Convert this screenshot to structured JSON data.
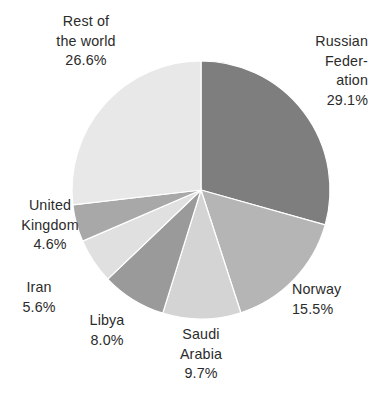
{
  "chart_data": {
    "type": "pie",
    "title": "",
    "subtitle": "",
    "xlabel": "",
    "ylabel": "",
    "legend_position": "none",
    "grid": false,
    "labels_outside": true,
    "start_angle_deg": 0,
    "direction": "clockwise",
    "categories": [
      "Russian Federation",
      "Norway",
      "Saudi Arabia",
      "Libya",
      "Iran",
      "United Kingdom",
      "Rest of the world"
    ],
    "values": [
      29.1,
      15.5,
      9.7,
      8.0,
      5.6,
      4.6,
      26.6
    ],
    "value_unit": "%",
    "slices": [
      {
        "name": "Russian Federation",
        "value": 29.1,
        "value_label": "29.1%",
        "color": "#7e7e7e",
        "label_lines": "Russian\nFeder-\nation\n29.1%"
      },
      {
        "name": "Norway",
        "value": 15.5,
        "value_label": "15.5%",
        "color": "#b5b5b5",
        "label_lines": "Norway\n15.5%"
      },
      {
        "name": "Saudi Arabia",
        "value": 9.7,
        "value_label": "9.7%",
        "color": "#d4d4d4",
        "label_lines": "Saudi\nArabia\n9.7%"
      },
      {
        "name": "Libya",
        "value": 8.0,
        "value_label": "8.0%",
        "color": "#9a9a9a",
        "label_lines": "Libya\n8.0%"
      },
      {
        "name": "Iran",
        "value": 5.6,
        "value_label": "5.6%",
        "color": "#e0e0e0",
        "label_lines": "Iran\n5.6%"
      },
      {
        "name": "United Kingdom",
        "value": 4.6,
        "value_label": "4.6%",
        "color": "#a8a8a8",
        "label_lines": "United\nKingdom\n4.6%"
      },
      {
        "name": "Rest of the world",
        "value": 26.6,
        "value_label": "26.6%",
        "color": "#e8e8e8",
        "label_lines": "Rest of\nthe world\n26.6%"
      }
    ],
    "geometry": {
      "center_x": 201,
      "center_y": 190,
      "radius": 129
    }
  },
  "labels": {
    "rest_of_world": "Rest of\nthe world\n26.6%",
    "russian_federation": "Russian\nFeder-\nation\n29.1%",
    "norway": "Norway\n15.5%",
    "saudi_arabia": "Saudi\nArabia\n9.7%",
    "libya": "Libya\n8.0%",
    "iran": "Iran\n5.6%",
    "united_kingdom": "United\nKingdom\n4.6%"
  },
  "colors": {
    "background": "#ffffff",
    "text": "#2b2b2b",
    "russian_federation": "#7e7e7e",
    "norway": "#b5b5b5",
    "saudi_arabia": "#d4d4d4",
    "libya": "#9a9a9a",
    "iran": "#e0e0e0",
    "united_kingdom": "#a8a8a8",
    "rest_of_world": "#e8e8e8"
  }
}
